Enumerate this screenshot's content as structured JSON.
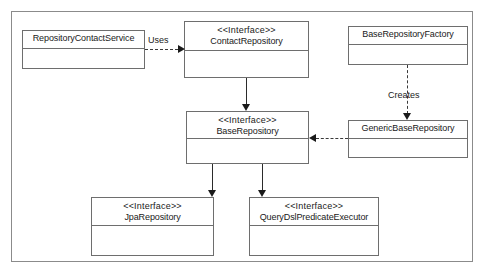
{
  "diagram": {
    "type": "uml-class-diagram",
    "stereotype_interface": "<<Interface>>",
    "classes": [
      {
        "id": "repository-contact-service",
        "stereotype": "",
        "name": "RepositoryContactService"
      },
      {
        "id": "contact-repository",
        "stereotype": "<<Interface>>",
        "name": "ContactRepository"
      },
      {
        "id": "base-repository-factory",
        "stereotype": "",
        "name": "BaseRepositoryFactory"
      },
      {
        "id": "base-repository",
        "stereotype": "<<Interface>>",
        "name": "BaseRepository"
      },
      {
        "id": "generic-base-repository",
        "stereotype": "",
        "name": "GenericBaseRepository"
      },
      {
        "id": "jpa-repository",
        "stereotype": "<<Interface>>",
        "name": "JpaRepository"
      },
      {
        "id": "querydsl-predicate-executor",
        "stereotype": "<<Interface>>",
        "name": "QueryDslPredicateExecutor"
      }
    ],
    "edges": [
      {
        "id": "uses-edge",
        "label": "Uses",
        "from": "repository-contact-service",
        "to": "contact-repository",
        "style": "dashed",
        "arrow": "open-filled"
      },
      {
        "id": "creates-edge",
        "label": "Creates",
        "from": "base-repository-factory",
        "to": "generic-base-repository",
        "style": "dashed",
        "arrow": "filled"
      },
      {
        "id": "realizes-edge",
        "label": "",
        "from": "generic-base-repository",
        "to": "base-repository",
        "style": "dashed",
        "arrow": "filled"
      },
      {
        "id": "contact-extends-base-edge",
        "label": "",
        "from": "contact-repository",
        "to": "base-repository",
        "style": "solid",
        "arrow": "filled"
      },
      {
        "id": "base-extends-jpa-edge",
        "label": "",
        "from": "base-repository",
        "to": "jpa-repository",
        "style": "solid",
        "arrow": "filled"
      },
      {
        "id": "base-extends-querydsl-edge",
        "label": "",
        "from": "base-repository",
        "to": "querydsl-predicate-executor",
        "style": "solid",
        "arrow": "filled"
      }
    ],
    "colors": {
      "background": "#ffffff",
      "box_border": "#6e6e6e",
      "frame_border": "#8b8b8b",
      "connector": "#2b2b2b",
      "text": "#1a1a1a"
    }
  }
}
